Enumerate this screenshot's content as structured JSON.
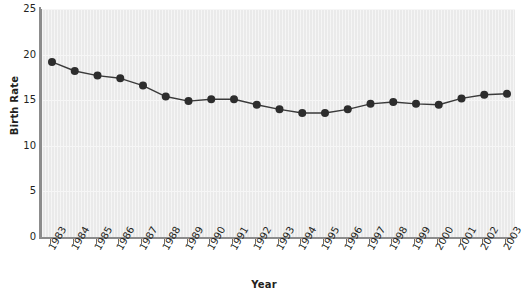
{
  "chart_data": {
    "type": "line",
    "title": "",
    "xlabel": "Year",
    "ylabel": "Birth Rate",
    "ylim": [
      0,
      25
    ],
    "yticks": [
      0,
      5,
      10,
      15,
      20,
      25
    ],
    "grid": true,
    "legend": "none",
    "marker": "circle",
    "line_color": "#3a3a3a",
    "marker_color": "#2d2d2d",
    "plot_background": "#eaeaea",
    "categories": [
      "1983",
      "1984",
      "1985",
      "1986",
      "1987",
      "1988",
      "1989",
      "1990",
      "1991",
      "1992",
      "1993",
      "1994",
      "1995",
      "1996",
      "1997",
      "1998",
      "1999",
      "2000",
      "2001",
      "2002",
      "2003"
    ],
    "values": [
      19.2,
      18.2,
      17.7,
      17.4,
      16.6,
      15.4,
      14.9,
      15.1,
      15.1,
      14.5,
      14.0,
      13.6,
      13.6,
      14.0,
      14.6,
      14.8,
      14.6,
      14.5,
      15.2,
      15.6,
      15.7
    ],
    "series": [
      {
        "name": "Birth Rate",
        "values": [
          19.2,
          18.2,
          17.7,
          17.4,
          16.6,
          15.4,
          14.9,
          15.1,
          15.1,
          14.5,
          14.0,
          13.6,
          13.6,
          14.0,
          14.6,
          14.8,
          14.6,
          14.5,
          15.2,
          15.6,
          15.7
        ]
      }
    ]
  }
}
